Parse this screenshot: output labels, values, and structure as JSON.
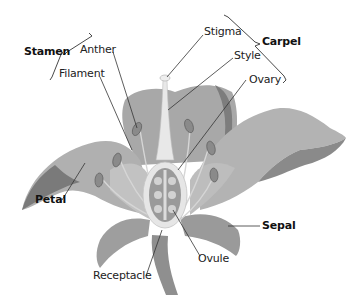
{
  "diagram": {
    "colors": {
      "background": "#ffffff",
      "petal": "#a9a9a9",
      "petal_dark": "#7d7d7d",
      "petal_light": "#c4c4c4",
      "pistil": "#e6e6e6",
      "ovary_inner": "#9a9a9a",
      "ovule": "#d2d2d2",
      "anther": "#8a8a8a",
      "leader_line": "#333333",
      "text": "#222222"
    },
    "groups": [
      {
        "label": "Stamen",
        "bold": true,
        "members": [
          "Anther",
          "Filament"
        ]
      },
      {
        "label": "Carpel",
        "bold": true,
        "members": [
          "Stigma",
          "Style",
          "Ovary"
        ]
      }
    ],
    "labels": {
      "stamen": "Stamen",
      "anther": "Anther",
      "filament": "Filament",
      "stigma": "Stigma",
      "carpel": "Carpel",
      "style": "Style",
      "ovary": "Ovary",
      "petal": "Petal",
      "sepal": "Sepal",
      "ovule": "Ovule",
      "receptacle": "Receptacle"
    }
  }
}
